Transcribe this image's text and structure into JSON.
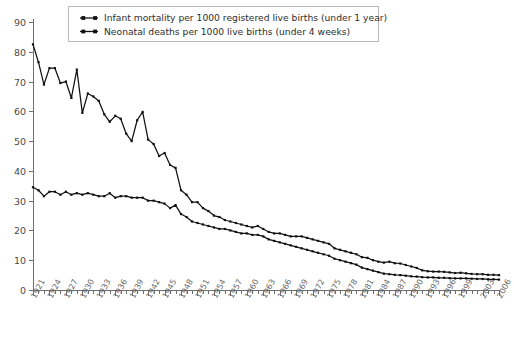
{
  "chart_data": {
    "type": "line",
    "title": "",
    "subtitle": "",
    "xlabel": "",
    "ylabel": "",
    "ylim": [
      0,
      90
    ],
    "xlim": [
      1921,
      2006
    ],
    "ytick_step": 10,
    "yticks": [
      "0",
      "10",
      "20",
      "30",
      "40",
      "50",
      "60",
      "70",
      "80",
      "90"
    ],
    "grid": false,
    "legend_position": "top-center",
    "x_label_interval": 3,
    "xticks": [
      "1921",
      "1924",
      "1927",
      "1930",
      "1933",
      "1936",
      "1939",
      "1942",
      "1945",
      "1948",
      "1951",
      "1954",
      "1957",
      "1960",
      "1963",
      "1966",
      "1969",
      "1972",
      "1975",
      "1978",
      "1981",
      "1984",
      "1987",
      "1990",
      "1993",
      "1996",
      "1999",
      "2003",
      "2006"
    ],
    "x": [
      1921,
      1922,
      1923,
      1924,
      1925,
      1926,
      1927,
      1928,
      1929,
      1930,
      1931,
      1932,
      1933,
      1934,
      1935,
      1936,
      1937,
      1938,
      1939,
      1940,
      1941,
      1942,
      1943,
      1944,
      1945,
      1946,
      1947,
      1948,
      1949,
      1950,
      1951,
      1952,
      1953,
      1954,
      1955,
      1956,
      1957,
      1958,
      1959,
      1960,
      1961,
      1962,
      1963,
      1964,
      1965,
      1966,
      1967,
      1968,
      1969,
      1970,
      1971,
      1972,
      1973,
      1974,
      1975,
      1976,
      1977,
      1978,
      1979,
      1980,
      1981,
      1982,
      1983,
      1984,
      1985,
      1986,
      1987,
      1988,
      1989,
      1990,
      1991,
      1992,
      1993,
      1994,
      1995,
      1996,
      1997,
      1998,
      1999,
      2000,
      2001,
      2002,
      2003,
      2004,
      2005,
      2006
    ],
    "series": [
      {
        "name": "Infant mortality per 1000 registered live births (under 1 year)",
        "color": "#111111",
        "marker": "square",
        "values": [
          82.5,
          76.5,
          69.0,
          74.5,
          74.5,
          69.5,
          70.0,
          64.5,
          74.0,
          59.5,
          66.0,
          65.0,
          63.5,
          59.0,
          56.5,
          58.5,
          57.5,
          52.5,
          50.0,
          57.0,
          59.8,
          50.5,
          49.0,
          45.0,
          46.0,
          42.0,
          41.0,
          33.5,
          32.0,
          29.5,
          29.5,
          27.5,
          26.5,
          25.0,
          24.5,
          23.5,
          23.0,
          22.5,
          22.0,
          21.5,
          21.0,
          21.5,
          20.5,
          19.5,
          19.0,
          19.0,
          18.5,
          18.0,
          18.0,
          18.0,
          17.5,
          17.0,
          16.5,
          16.0,
          15.5,
          14.0,
          13.5,
          13.0,
          12.5,
          12.0,
          11.0,
          10.8,
          10.0,
          9.5,
          9.2,
          9.5,
          9.0,
          8.9,
          8.4,
          7.9,
          7.4,
          6.6,
          6.3,
          6.2,
          6.2,
          6.1,
          5.9,
          5.7,
          5.8,
          5.6,
          5.4,
          5.3,
          5.3,
          5.1,
          5.1,
          5.0
        ]
      },
      {
        "name": "Neonatal deaths per 1000 live births (under 4 weeks)",
        "color": "#111111",
        "marker": "square",
        "values": [
          34.5,
          33.5,
          31.5,
          33.0,
          33.0,
          32.0,
          33.0,
          32.0,
          32.5,
          32.0,
          32.5,
          32.0,
          31.5,
          31.5,
          32.5,
          31.0,
          31.5,
          31.5,
          31.0,
          31.0,
          31.0,
          30.0,
          30.0,
          29.5,
          29.0,
          27.5,
          28.5,
          25.5,
          24.5,
          23.0,
          22.5,
          22.0,
          21.5,
          21.0,
          20.5,
          20.5,
          20.0,
          19.5,
          19.0,
          19.0,
          18.5,
          18.5,
          18.0,
          17.0,
          16.5,
          16.0,
          15.5,
          15.0,
          14.5,
          14.0,
          13.5,
          13.0,
          12.5,
          12.0,
          11.5,
          10.5,
          10.0,
          9.5,
          9.0,
          8.5,
          7.5,
          7.0,
          6.5,
          6.0,
          5.5,
          5.3,
          5.1,
          5.0,
          4.8,
          4.6,
          4.5,
          4.3,
          4.2,
          4.2,
          4.1,
          4.1,
          4.0,
          3.9,
          3.9,
          3.9,
          3.8,
          3.7,
          3.7,
          3.6,
          3.6,
          3.5
        ]
      }
    ]
  },
  "legend": {
    "items": [
      {
        "label": "Infant mortality per 1000 registered live births (under 1 year)"
      },
      {
        "label": "Neonatal deaths per 1000 live births (under 4 weeks)"
      }
    ]
  },
  "footnote": {
    "text": ""
  }
}
